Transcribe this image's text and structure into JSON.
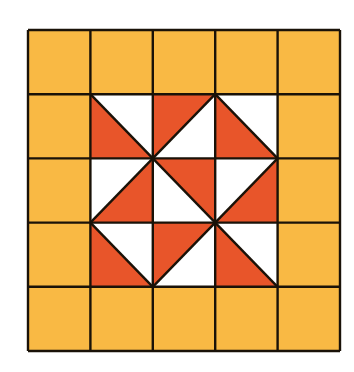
{
  "diagram": {
    "title": "",
    "grid": {
      "rows": 5,
      "cols": 5
    },
    "colors": {
      "background": "#ffffff",
      "border_fill": "#F9B944",
      "accent": "#E8552A",
      "light": "#FFFFFF",
      "line": "#1a1208"
    },
    "inner_cells": [
      {
        "row": 1,
        "col": 1,
        "diagonal": "tl-br",
        "filled": "bottom-left"
      },
      {
        "row": 1,
        "col": 2,
        "diagonal": "bl-tr",
        "filled": "top-left"
      },
      {
        "row": 1,
        "col": 3,
        "diagonal": "tl-br",
        "filled": "bottom-left"
      },
      {
        "row": 2,
        "col": 1,
        "diagonal": "bl-tr",
        "filled": "bottom-right"
      },
      {
        "row": 2,
        "col": 2,
        "diagonal": "tl-br",
        "filled": "top-right"
      },
      {
        "row": 2,
        "col": 3,
        "diagonal": "bl-tr",
        "filled": "bottom-right"
      },
      {
        "row": 3,
        "col": 1,
        "diagonal": "tl-br",
        "filled": "bottom-left"
      },
      {
        "row": 3,
        "col": 2,
        "diagonal": "bl-tr",
        "filled": "top-left"
      },
      {
        "row": 3,
        "col": 3,
        "diagonal": "tl-br",
        "filled": "bottom-left"
      }
    ]
  }
}
